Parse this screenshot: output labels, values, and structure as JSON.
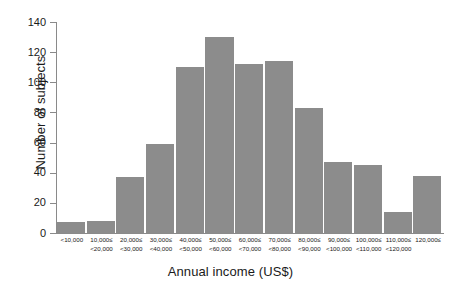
{
  "chart_data": {
    "type": "bar",
    "title": "",
    "xlabel": "Annual income (US$)",
    "ylabel": "Number of subjects",
    "ylim": [
      0,
      140
    ],
    "yticks": [
      0,
      20,
      40,
      60,
      80,
      100,
      120,
      140
    ],
    "grid": false,
    "legend": null,
    "bar_color": "#8c8c8c",
    "categories": [
      "<10,000",
      "10,000≤ <20,000",
      "20,000≤ <30,000",
      "30,000≤ <40,000",
      "40,000≤ <50,000",
      "50,000≤ <60,000",
      "60,000≤ <70,000",
      "70,000≤ <80,000",
      "80,000≤ <90,000",
      "90,000≤ <100,000",
      "100,000≤ <110,000",
      "110,000≤ <120,000",
      "120,000≤"
    ],
    "category_lines": [
      {
        "line1": "<10,000",
        "line2": ""
      },
      {
        "line1": "10,000≤",
        "line2": "<20,000"
      },
      {
        "line1": "20,000≤",
        "line2": "<30,000"
      },
      {
        "line1": "30,000≤",
        "line2": "<40,000"
      },
      {
        "line1": "40,000≤",
        "line2": "<50,000"
      },
      {
        "line1": "50,000≤",
        "line2": "<60,000"
      },
      {
        "line1": "60,000≤",
        "line2": "<70,000"
      },
      {
        "line1": "70,000≤",
        "line2": "<80,000"
      },
      {
        "line1": "80,000≤",
        "line2": "<90,000"
      },
      {
        "line1": "90,000≤",
        "line2": "<100,000"
      },
      {
        "line1": "100,000≤",
        "line2": "<110,000"
      },
      {
        "line1": "110,000≤",
        "line2": "<120,000"
      },
      {
        "line1": "120,000≤",
        "line2": ""
      }
    ],
    "values": [
      7,
      8,
      37,
      59,
      110,
      130,
      112,
      114,
      83,
      47,
      45,
      14,
      38
    ]
  }
}
